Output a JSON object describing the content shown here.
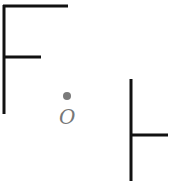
{
  "diagram": {
    "type": "geometric-rotation",
    "center_point": {
      "label": "O",
      "x": 67,
      "y": 95,
      "color": "#7a7a7a"
    },
    "stroke_color": "#111111",
    "shapes": [
      {
        "name": "original-F",
        "segments": [
          {
            "x1": 4,
            "y1": 6,
            "x2": 4,
            "y2": 114
          },
          {
            "x1": 4,
            "y1": 6,
            "x2": 68,
            "y2": 6
          },
          {
            "x1": 4,
            "y1": 57,
            "x2": 41,
            "y2": 57
          }
        ]
      },
      {
        "name": "rotated-F",
        "segments": [
          {
            "x1": 131,
            "y1": 79,
            "x2": 131,
            "y2": 181
          },
          {
            "x1": 131,
            "y1": 135,
            "x2": 168,
            "y2": 135
          }
        ]
      }
    ]
  }
}
